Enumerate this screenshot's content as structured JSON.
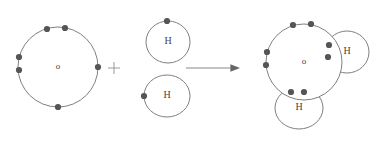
{
  "diagram": {
    "type": "chemistry-bonding-diagram",
    "background_color": "#ffffff",
    "circle_stroke_color": "#808080",
    "electron_dot_color": "#555555",
    "label_color": "#444444",
    "operator_color": "#999999",
    "arrow_color": "#888888"
  },
  "reactants": {
    "oxygen": {
      "label": "o",
      "cx": 58,
      "cy": 67,
      "r": 40,
      "electron_count": 6,
      "electrons": [
        {
          "name": "top-left-dot",
          "x": 47,
          "y": 29
        },
        {
          "name": "top-right-dot",
          "x": 65,
          "y": 28
        },
        {
          "name": "left-upper-dot",
          "x": 19,
          "y": 57
        },
        {
          "name": "left-lower-dot",
          "x": 19,
          "y": 70
        },
        {
          "name": "right-dot",
          "x": 98,
          "y": 67
        },
        {
          "name": "bottom-dot",
          "x": 58,
          "y": 107
        }
      ]
    },
    "hydrogen_1": {
      "label": "H",
      "cx": 168,
      "cy": 42,
      "rx": 22,
      "ry": 21,
      "electron_count": 1,
      "electrons": [
        {
          "name": "top-dot",
          "x": 167,
          "y": 21
        }
      ]
    },
    "hydrogen_2": {
      "label": "H",
      "cx": 167,
      "cy": 96,
      "rx": 23,
      "ry": 21,
      "electron_count": 1,
      "electrons": [
        {
          "name": "left-dot",
          "x": 144,
          "y": 96
        }
      ]
    }
  },
  "operators": {
    "plus": {
      "symbol": "+",
      "x": 114,
      "y": 68,
      "arm": 6
    },
    "arrow": {
      "symbol": "→",
      "x1": 186,
      "y1": 68,
      "x2": 240,
      "y2": 68,
      "head_size": 6
    }
  },
  "product": {
    "name": "water",
    "oxygen": {
      "label": "o",
      "cx": 304,
      "cy": 62,
      "r": 38,
      "lone_pairs": [
        {
          "name": "top-left-dot",
          "x": 293,
          "y": 25
        },
        {
          "name": "top-right-dot",
          "x": 311,
          "y": 24
        },
        {
          "name": "left-upper-dot",
          "x": 267,
          "y": 52
        },
        {
          "name": "left-lower-dot",
          "x": 266,
          "y": 65
        }
      ]
    },
    "hydrogen_right": {
      "label": "H",
      "cx": 347,
      "cy": 52,
      "rx": 22,
      "ry": 21,
      "shared_electrons": [
        {
          "name": "bond-dot-upper",
          "x": 329,
          "y": 45
        },
        {
          "name": "bond-dot-lower",
          "x": 328,
          "y": 57
        }
      ]
    },
    "hydrogen_bottom": {
      "label": "H",
      "cx": 299,
      "cy": 108,
      "rx": 24,
      "ry": 21,
      "shared_electrons": [
        {
          "name": "bond-dot-left",
          "x": 291,
          "y": 92
        },
        {
          "name": "bond-dot-right",
          "x": 304,
          "y": 92
        }
      ]
    }
  }
}
